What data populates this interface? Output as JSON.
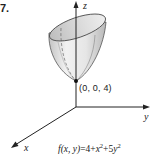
{
  "figure": {
    "number": "7.",
    "axes": {
      "x_label": "x",
      "y_label": "y",
      "z_label": "z"
    },
    "vertex_point_label": "(0, 0, 4)",
    "function": {
      "lhs": "f(x, y)",
      "eq": "=",
      "c0": "4",
      "plus1": "+",
      "t1": "x",
      "t1_exp": "2",
      "plus2": "+",
      "t2_coef": "5",
      "t2": "y",
      "t2_exp": "2"
    },
    "colors": {
      "surface_light": "#eeeeee",
      "surface_dark": "#bdbdbd",
      "line": "#222222"
    }
  }
}
